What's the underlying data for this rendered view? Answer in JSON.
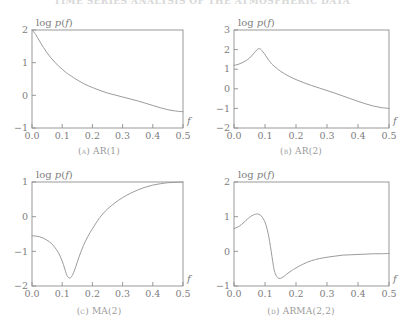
{
  "running_head": "TIME SERIES ANALYSIS OF THE ATMOSPHERIC DATA",
  "figure": {
    "background_color": "#ffffff",
    "line_color": "#9b9b9b",
    "axis_color": "#8f8f8f",
    "text_color": "#7d7d7d"
  },
  "axis_labels": {
    "y_label_prefix": "log ",
    "y_label_p": "p",
    "y_label_paren_open": "(",
    "y_label_f": "f",
    "y_label_paren_close": ")",
    "x_label": "f"
  },
  "panels": [
    {
      "key": "a",
      "caption": "(a)  AR(1)"
    },
    {
      "key": "b",
      "caption": "(b)  AR(2)"
    },
    {
      "key": "c",
      "caption": "(c)  MA(2)"
    },
    {
      "key": "d",
      "caption": "(d)  ARMA(2,2)"
    }
  ],
  "chart_data": [
    {
      "type": "line",
      "panel": "a",
      "title": "(a)  AR(1)",
      "xlabel": "f",
      "ylabel": "log p(f)",
      "xlim": [
        0.0,
        0.5
      ],
      "ylim": [
        -1,
        2
      ],
      "xticks": [
        "0.0",
        "0.1",
        "0.2",
        "0.3",
        "0.4",
        "0.5"
      ],
      "xtick_values": [
        0.0,
        0.1,
        0.2,
        0.3,
        0.4,
        0.5
      ],
      "yticks": [
        "2",
        "1",
        "0",
        "-1"
      ],
      "ytick_values": [
        2,
        1,
        0,
        -1
      ],
      "grid": false,
      "legend": "none",
      "x": [
        0.0,
        0.0125,
        0.025,
        0.0375,
        0.05,
        0.0625,
        0.075,
        0.0875,
        0.1,
        0.1125,
        0.125,
        0.15,
        0.175,
        0.2,
        0.225,
        0.25,
        0.275,
        0.3,
        0.325,
        0.35,
        0.375,
        0.4,
        0.425,
        0.45,
        0.475,
        0.5
      ],
      "y": [
        2.0,
        1.86,
        1.66,
        1.47,
        1.3,
        1.15,
        1.02,
        0.9,
        0.8,
        0.7,
        0.62,
        0.47,
        0.34,
        0.24,
        0.15,
        0.07,
        0.01,
        -0.05,
        -0.11,
        -0.17,
        -0.24,
        -0.31,
        -0.38,
        -0.44,
        -0.48,
        -0.5
      ]
    },
    {
      "type": "line",
      "panel": "b",
      "title": "(b)  AR(2)",
      "xlabel": "f",
      "ylabel": "log p(f)",
      "xlim": [
        0.0,
        0.5
      ],
      "ylim": [
        -2,
        3
      ],
      "xticks": [
        "0.0",
        "0.1",
        "0.2",
        "0.3",
        "0.4",
        "0.5"
      ],
      "xtick_values": [
        0.0,
        0.1,
        0.2,
        0.3,
        0.4,
        0.5
      ],
      "yticks": [
        "3",
        "2",
        "1",
        "0",
        "-1",
        "-2"
      ],
      "ytick_values": [
        3,
        2,
        1,
        0,
        -1,
        -2
      ],
      "grid": false,
      "legend": "none",
      "x": [
        0.0,
        0.0125,
        0.025,
        0.0375,
        0.05,
        0.0625,
        0.07,
        0.075,
        0.08,
        0.085,
        0.09,
        0.0975,
        0.105,
        0.115,
        0.125,
        0.15,
        0.175,
        0.2,
        0.225,
        0.25,
        0.275,
        0.3,
        0.325,
        0.35,
        0.375,
        0.4,
        0.425,
        0.45,
        0.475,
        0.5
      ],
      "y": [
        1.2,
        1.24,
        1.32,
        1.43,
        1.57,
        1.78,
        1.92,
        2.0,
        2.05,
        2.03,
        1.95,
        1.8,
        1.62,
        1.4,
        1.22,
        0.9,
        0.66,
        0.47,
        0.31,
        0.17,
        0.04,
        -0.09,
        -0.22,
        -0.36,
        -0.5,
        -0.64,
        -0.77,
        -0.88,
        -0.96,
        -1.0
      ]
    },
    {
      "type": "line",
      "panel": "c",
      "title": "(c)  MA(2)",
      "xlabel": "f",
      "ylabel": "log p(f)",
      "xlim": [
        0.0,
        0.5
      ],
      "ylim": [
        -2,
        1
      ],
      "xticks": [
        "0.0",
        "0.1",
        "0.2",
        "0.3",
        "0.4",
        "0.5"
      ],
      "xtick_values": [
        0.0,
        0.1,
        0.2,
        0.3,
        0.4,
        0.5
      ],
      "yticks": [
        "1",
        "0",
        "-1",
        "-2"
      ],
      "ytick_values": [
        1,
        0,
        -1,
        -2
      ],
      "grid": false,
      "legend": "none",
      "x": [
        0.0,
        0.0125,
        0.025,
        0.0375,
        0.05,
        0.0625,
        0.075,
        0.0875,
        0.1,
        0.1075,
        0.115,
        0.12,
        0.125,
        0.13,
        0.1375,
        0.145,
        0.155,
        0.17,
        0.185,
        0.2,
        0.225,
        0.25,
        0.275,
        0.3,
        0.325,
        0.35,
        0.375,
        0.4,
        0.425,
        0.45,
        0.475,
        0.5
      ],
      "y": [
        -0.55,
        -0.56,
        -0.58,
        -0.62,
        -0.68,
        -0.76,
        -0.88,
        -1.04,
        -1.28,
        -1.48,
        -1.68,
        -1.75,
        -1.77,
        -1.74,
        -1.62,
        -1.44,
        -1.18,
        -0.84,
        -0.57,
        -0.35,
        -0.02,
        0.22,
        0.4,
        0.55,
        0.67,
        0.77,
        0.85,
        0.91,
        0.95,
        0.98,
        0.99,
        1.0
      ]
    },
    {
      "type": "line",
      "panel": "d",
      "title": "(d)  ARMA(2,2)",
      "xlabel": "f",
      "ylabel": "log p(f)",
      "xlim": [
        0.0,
        0.5
      ],
      "ylim": [
        -1,
        2
      ],
      "xticks": [
        "0.0",
        "0.1",
        "0.2",
        "0.3",
        "0.4",
        "0.5"
      ],
      "xtick_values": [
        0.0,
        0.1,
        0.2,
        0.3,
        0.4,
        0.5
      ],
      "yticks": [
        "2",
        "1",
        "0",
        "-1"
      ],
      "ytick_values": [
        2,
        1,
        0,
        -1
      ],
      "grid": false,
      "legend": "none",
      "x": [
        0.0,
        0.0125,
        0.025,
        0.0375,
        0.05,
        0.0625,
        0.07,
        0.075,
        0.08,
        0.0875,
        0.095,
        0.1,
        0.105,
        0.11,
        0.115,
        0.12,
        0.125,
        0.13,
        0.1375,
        0.145,
        0.155,
        0.17,
        0.185,
        0.2,
        0.225,
        0.25,
        0.275,
        0.3,
        0.325,
        0.35,
        0.375,
        0.4,
        0.425,
        0.45,
        0.475,
        0.5
      ],
      "y": [
        0.66,
        0.7,
        0.78,
        0.88,
        0.98,
        1.05,
        1.07,
        1.08,
        1.07,
        1.03,
        0.93,
        0.84,
        0.7,
        0.52,
        0.28,
        0.0,
        -0.3,
        -0.56,
        -0.72,
        -0.78,
        -0.76,
        -0.66,
        -0.56,
        -0.48,
        -0.36,
        -0.27,
        -0.21,
        -0.17,
        -0.14,
        -0.11,
        -0.1,
        -0.09,
        -0.08,
        -0.07,
        -0.07,
        -0.06
      ]
    }
  ]
}
